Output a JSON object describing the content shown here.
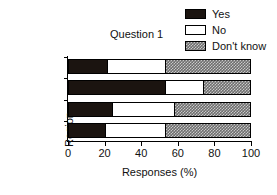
{
  "chart_data": {
    "type": "bar",
    "orientation": "horizontal",
    "stacked": true,
    "title": "Question 1",
    "xlabel": "Responses (%)",
    "ylabel": "Region",
    "categories": [
      "West",
      "East",
      "South",
      "North"
    ],
    "series": [
      {
        "name": "Yes",
        "values": [
          21,
          53,
          24,
          20
        ]
      },
      {
        "name": "No",
        "values": [
          32,
          21,
          34,
          33
        ]
      },
      {
        "name": "Don't know",
        "values": [
          47,
          26,
          42,
          47
        ]
      }
    ],
    "cumulative_boundaries": {
      "West": [
        21,
        53,
        100
      ],
      "East": [
        53,
        74,
        100
      ],
      "South": [
        24,
        58,
        100
      ],
      "North": [
        20,
        53,
        100
      ]
    },
    "xlim": [
      0,
      100
    ],
    "xticks": [
      0,
      20,
      40,
      60,
      80,
      100
    ],
    "xtick_labels": [
      "0",
      "20",
      "40",
      "60",
      "80",
      "100"
    ],
    "grid": false,
    "legend_position": "top-right",
    "colors": {
      "Yes": "#1b1410",
      "No": "#ffffff",
      "Don't know": "#6e6e6e",
      "axis": "#000000",
      "text": "#111111"
    }
  },
  "legend": {
    "items": [
      {
        "label": "Yes",
        "swatch": "yes-swatch"
      },
      {
        "label": "No",
        "swatch": "no-swatch"
      },
      {
        "label": "Don't know",
        "swatch": "dont-know-swatch"
      }
    ]
  }
}
